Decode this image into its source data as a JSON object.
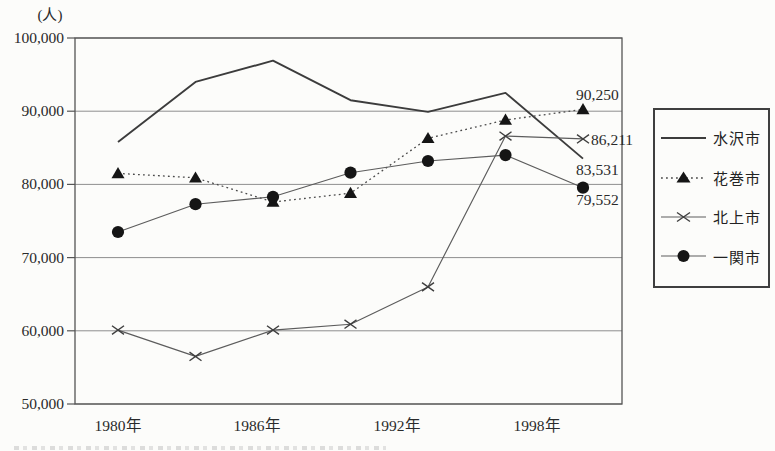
{
  "unit": "(人)",
  "chart_data": {
    "type": "line",
    "title": "",
    "unit": "(人)",
    "x_years": [
      "1980",
      "1983",
      "1986",
      "1989",
      "1992",
      "1995",
      "1998"
    ],
    "x_tick_labels": [
      "1980年",
      "1986年",
      "1992年",
      "1998年"
    ],
    "y_tick_labels": [
      "100,000",
      "90,000",
      "80,000",
      "70,000",
      "60,000",
      "50,000"
    ],
    "y_tick_values": [
      100000,
      90000,
      80000,
      70000,
      60000,
      50000
    ],
    "ylim": [
      50000,
      100000
    ],
    "grid": "horizontal",
    "legend_position": "right",
    "series": [
      {
        "name": "水沢市",
        "line_style": "solid",
        "marker": "none",
        "values": [
          85800,
          94000,
          96900,
          91500,
          89900,
          92500,
          83531
        ]
      },
      {
        "name": "花巻市",
        "line_style": "dotted",
        "marker": "triangle",
        "values": [
          81500,
          80900,
          77600,
          78800,
          86300,
          88800,
          90250
        ]
      },
      {
        "name": "北上市",
        "line_style": "solid-thin",
        "marker": "x",
        "values": [
          60100,
          56500,
          60100,
          60900,
          66000,
          86600,
          86211
        ]
      },
      {
        "name": "一関市",
        "line_style": "solid-thin",
        "marker": "circle",
        "values": [
          73500,
          77300,
          78300,
          81600,
          83200,
          84000,
          79552
        ]
      }
    ],
    "end_labels": [
      {
        "series": "花巻市",
        "value": 90250,
        "text": "90,250"
      },
      {
        "series": "北上市",
        "value": 86211,
        "text": "86,211"
      },
      {
        "series": "水沢市",
        "value": 83531,
        "text": "83,531"
      },
      {
        "series": "一関市",
        "value": 79552,
        "text": "79,552"
      }
    ]
  },
  "colors": {
    "background": "#fcfcfa",
    "grid": "#8e8e8e",
    "frame": "#555555",
    "line_solid": "#3c3c3c",
    "line_dotted": "#4a4a4a",
    "line_thin": "#5c5c5c",
    "marker_fill": "#151515",
    "text": "#2a2a2a"
  }
}
